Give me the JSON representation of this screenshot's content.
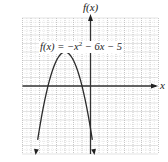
{
  "chart_data": {
    "type": "line",
    "title": "",
    "function": "f(x) = -x^2 - 6x - 5",
    "equation_label": {
      "lhs": "f(x) = ",
      "neg": "−",
      "var": "x",
      "exp": "2",
      "rest": " − 6x − 5"
    },
    "xlabel": "x",
    "ylabel": "f(x)",
    "xlim": [
      -8,
      8
    ],
    "ylim": [
      -8,
      8
    ],
    "grid": true,
    "grid_major_step": 1,
    "vertex": [
      -3,
      4
    ],
    "roots": [
      -5,
      -1
    ],
    "series": [
      {
        "name": "f(x) = -x^2 - 6x - 5",
        "x": [
          -6.46,
          -6,
          -5,
          -4,
          -3,
          -2,
          -1,
          0,
          0.46
        ],
        "y": [
          -8,
          -5,
          0,
          3,
          4,
          3,
          0,
          -5,
          -8
        ]
      }
    ],
    "colors": {
      "axis": "#333333",
      "curve": "#2a2a2a",
      "grid": "#b0b0b0"
    }
  }
}
